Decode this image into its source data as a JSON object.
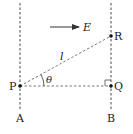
{
  "diagram": {
    "field_label": "E",
    "length_label": "l",
    "angle_label": "θ",
    "points": {
      "P": "P",
      "Q": "Q",
      "R": "R"
    },
    "lines": {
      "A": "A",
      "B": "B"
    },
    "colors": {
      "stroke": "#333333",
      "text": "#222222",
      "background": "#ffffff"
    }
  }
}
